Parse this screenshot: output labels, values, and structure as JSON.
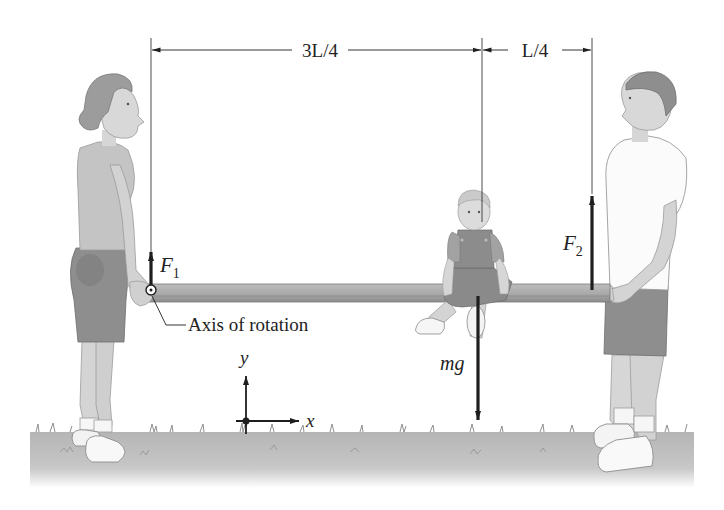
{
  "diagram": {
    "type": "static-equilibrium",
    "dimensions": {
      "left_span_label": "3L/4",
      "right_span_label": "L/4"
    },
    "forces": {
      "f1": {
        "symbol": "F",
        "subscript": "1"
      },
      "f2": {
        "symbol": "F",
        "subscript": "2"
      },
      "weight": {
        "label": "mg"
      }
    },
    "annotations": {
      "axis_label": "Axis of rotation"
    },
    "axes": {
      "x_label": "x",
      "y_label": "y"
    },
    "figures": [
      "woman",
      "child",
      "man"
    ],
    "colors": {
      "ink": "#1e1e1e",
      "plank": "#a8a8a8",
      "plank_edge": "#7a7a7a",
      "grass": "#b9b9b9",
      "skin": "#cfcfcf",
      "shorts": "#8e8e8e",
      "shirt_woman": "#c4c4c4",
      "shirt_man": "#fbfbfb"
    }
  }
}
